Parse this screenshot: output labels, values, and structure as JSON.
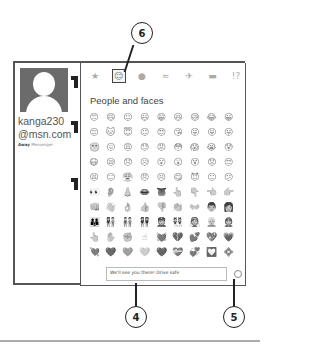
{
  "contact": {
    "username_line1": "kanga230",
    "username_line2": "@msn.com",
    "status_label": "Away",
    "status_service": "Messenger"
  },
  "emoji_picker": {
    "categories": [
      {
        "name": "favorites",
        "glyph": "★"
      },
      {
        "name": "people-and-faces",
        "glyph": "☺",
        "selected": true
      },
      {
        "name": "places",
        "glyph": "●"
      },
      {
        "name": "food",
        "glyph": "≈"
      },
      {
        "name": "travel",
        "glyph": "✈"
      },
      {
        "name": "nature",
        "glyph": "▬"
      },
      {
        "name": "symbols",
        "glyph": "!?"
      }
    ],
    "section_title": "People and faces",
    "emojis": [
      "😊",
      "😄",
      "☺",
      "😃",
      "😁",
      "😆",
      "😅",
      "😂",
      "😀",
      "😌",
      "🐱",
      "😇",
      "😉",
      "😍",
      "😘",
      "😜",
      "😝",
      "😛",
      "😬",
      "😖",
      "😩",
      "😓",
      "😡",
      "😳",
      "😱",
      "😭",
      "😰",
      "😷",
      "😪",
      "😞",
      "😥",
      "😮",
      "😲",
      "😵",
      "😟",
      "😒",
      "😫",
      "😑",
      "😤",
      "😠",
      "😣",
      "😋",
      "😈",
      "😐",
      "😕",
      "👀",
      "👂",
      "👃",
      "👄",
      "👅",
      "👆",
      "👇",
      "👈",
      "👉",
      "👊",
      "👋",
      "👌",
      "👍",
      "👎",
      "👏",
      "👐",
      "👨",
      "👩",
      "👪",
      "👫",
      "👬",
      "👭",
      "👮",
      "👯",
      "👰",
      "👱",
      "👲",
      "👆",
      "✋",
      "✊",
      "☝",
      "💓",
      "💔",
      "💕",
      "💖",
      "💗",
      "💘",
      "💙",
      "💚",
      "💛",
      "💜",
      "💝",
      "💞",
      "💟",
      "💠"
    ]
  },
  "message_input": {
    "value": "We'll see you there! Drive safe"
  },
  "callouts": {
    "six": "6",
    "four": "4",
    "five": "5"
  }
}
